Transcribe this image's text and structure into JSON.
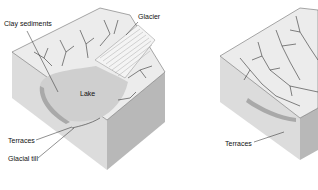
{
  "diagram": {
    "left_block": {
      "labels": {
        "clay_sediments": "Clay sediments",
        "glacier": "Glacier",
        "lake": "Lake",
        "terraces": "Terraces",
        "glacial_till": "Glacial till"
      }
    },
    "right_block": {
      "labels": {
        "terraces": "Terraces"
      }
    },
    "colors": {
      "top_surface": "#e9e9e9",
      "lake": "#cfcfcf",
      "front_face": "#dcdcdc",
      "side_face": "#b9b9b9",
      "lines": "#333333"
    }
  }
}
